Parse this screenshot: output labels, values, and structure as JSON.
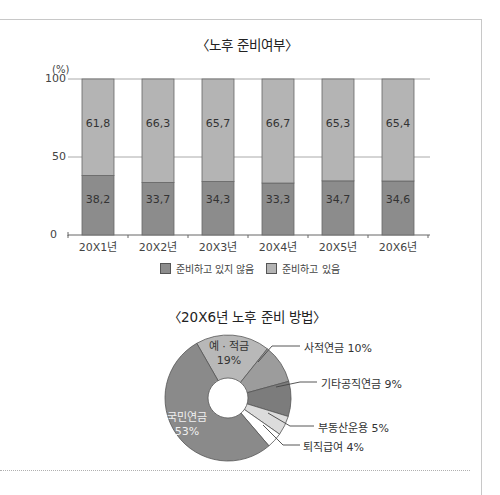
{
  "chart_data": [
    {
      "type": "bar",
      "stacked": true,
      "title": "〈노후 준비여부〉",
      "ylabel": "(%)",
      "xlabel": "",
      "ylim": [
        0,
        100
      ],
      "yticks": [
        "0",
        "50",
        "100"
      ],
      "grid": true,
      "categories": [
        "20X1년",
        "20X2년",
        "20X3년",
        "20X4년",
        "20X5년",
        "20X6년"
      ],
      "series": [
        {
          "name": "준비하고 있지 않음",
          "color": "#8c8c8c",
          "values": [
            38.2,
            33.7,
            34.3,
            33.3,
            34.7,
            34.6
          ],
          "labels": [
            "38,2",
            "33,7",
            "34,3",
            "33,3",
            "34,7",
            "34,6"
          ]
        },
        {
          "name": "준비하고 있음",
          "color": "#b4b4b4",
          "values": [
            61.8,
            66.3,
            65.7,
            66.7,
            65.3,
            65.4
          ],
          "labels": [
            "61,8",
            "66,3",
            "65,7",
            "66,7",
            "65,3",
            "65,4"
          ]
        }
      ],
      "legend_position": "bottom"
    },
    {
      "type": "pie",
      "donut": true,
      "title": "〈20X6년 노후 준비 방법〉",
      "slices": [
        {
          "name": "예 · 적금",
          "value": 19,
          "label": "19%",
          "color": "#b8b8b8"
        },
        {
          "name": "사적연금",
          "value": 10,
          "label": "사적연금 10%",
          "color": "#9c9c9c"
        },
        {
          "name": "기타공직연금",
          "value": 9,
          "label": "기타공직연금 9%",
          "color": "#7c7c7c"
        },
        {
          "name": "부동산운용",
          "value": 5,
          "label": "부동산운용 5%",
          "color": "#dcdcdc"
        },
        {
          "name": "퇴직급여",
          "value": 4,
          "label": "퇴직급여 4%",
          "color": "#ffffff"
        },
        {
          "name": "국민연금",
          "value": 53,
          "label": "53%",
          "color": "#8a8a8a"
        }
      ]
    }
  ],
  "bar": {
    "title": "〈노후 준비여부〉",
    "unit": "(%)",
    "yticks": [
      "100",
      "50",
      "0"
    ],
    "legend": [
      "준비하고 있지 않음",
      "준비하고 있음"
    ]
  },
  "pie": {
    "title": "〈20X6년 노후 준비 방법〉",
    "inner": {
      "savings_name": "예 · 적금",
      "savings_pct": "19%",
      "pension_name": "국민연금",
      "pension_pct": "53%"
    },
    "outer_labels": [
      "사적연금 10%",
      "기타공직연금 9%",
      "부동산운용 5%",
      "퇴직급여 4%"
    ]
  }
}
